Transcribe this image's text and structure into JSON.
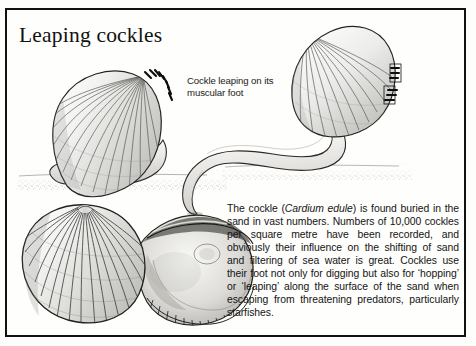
{
  "page": {
    "title": "Leaping cockles",
    "background_color": "#fdfdfb",
    "frame_color": "#111111"
  },
  "caption": {
    "text": "Cockle leaping on its muscular foot"
  },
  "body": {
    "paragraph_before_italic": "The cockle (",
    "italic_species": "Cardium edule",
    "paragraph_after_italic": ") is found buried in the sand in vast numbers. Numbers of 10,000 cockles per square metre have been recorded, and obviously their influence on the shifting of sand and filtering of sea water is great. Cockles use their foot not only for digging but also for ‘hopping’ or ‘leaping’ along the surface of the sand when escaping from threatening predators, particularly starfishes.",
    "full_text": "The cockle (Cardium edule) is found buried in the sand in vast numbers. Numbers of 10,000 cockles per square metre have been recorded, and obviously their influence on the shifting of sand and filtering of sea water is great. Cockles use their foot not only for digging but also for ‘hopping’ or ‘leaping’ along the surface of the sand when escaping from threatening predators, particularly starfishes."
  },
  "illustrations": [
    {
      "id": "cockle-resting",
      "name": "cockle-resting-on-foot-illustration",
      "description": "Cockle shell resting on sand with muscular foot extended"
    },
    {
      "id": "cockle-leaping",
      "name": "cockle-leaping-illustration",
      "description": "Cockle leaping, foot pushing against the sand"
    },
    {
      "id": "cockle-shell-pair",
      "name": "cockle-shell-pair-illustration",
      "description": "Pair of cockle shells, exterior and interior views"
    }
  ]
}
